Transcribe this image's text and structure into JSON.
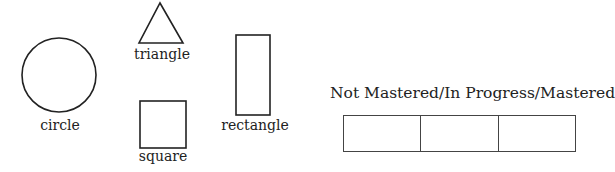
{
  "shapes": [
    {
      "name": "circle",
      "label": "circle"
    },
    {
      "name": "triangle",
      "label": "triangle"
    },
    {
      "name": "square",
      "label": "square"
    },
    {
      "name": "rectangle",
      "label": "rectangle"
    }
  ],
  "mastery": {
    "title": "Not Mastered/In Progress/Mastered",
    "cells": [
      "",
      "",
      ""
    ]
  }
}
